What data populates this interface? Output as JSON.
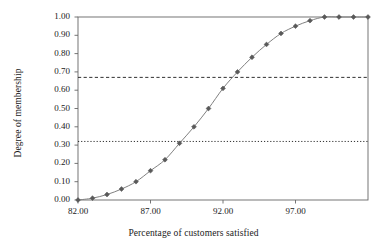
{
  "chart_data": {
    "type": "line",
    "title": "",
    "subtitle": "",
    "xlabel": "Percentage of customers satisfied",
    "ylabel": "Degree of membership",
    "xlim": [
      82,
      102
    ],
    "ylim": [
      0.0,
      1.0
    ],
    "grid": false,
    "legend": "none",
    "marker": "diamond",
    "line_color": "#808080",
    "marker_color": "#595959",
    "x": [
      82,
      83,
      84,
      85,
      86,
      87,
      88,
      89,
      90,
      91,
      92,
      93,
      94,
      95,
      96,
      97,
      98,
      99,
      100,
      101,
      102
    ],
    "y": [
      0.0,
      0.01,
      0.03,
      0.06,
      0.1,
      0.16,
      0.22,
      0.31,
      0.4,
      0.5,
      0.61,
      0.7,
      0.78,
      0.85,
      0.91,
      0.95,
      0.98,
      1.0,
      1.0,
      1.0,
      1.0
    ],
    "series": [
      {
        "name": "Degree of membership",
        "values": [
          0.0,
          0.01,
          0.03,
          0.06,
          0.1,
          0.16,
          0.22,
          0.31,
          0.4,
          0.5,
          0.61,
          0.7,
          0.78,
          0.85,
          0.91,
          0.95,
          0.98,
          1.0,
          1.0,
          1.0,
          1.0
        ]
      }
    ],
    "xticks": [
      82,
      87,
      92,
      97
    ],
    "xtick_labels": [
      "82.00",
      "87.00",
      "92.00",
      "97.00"
    ],
    "yticks": [
      0.0,
      0.1,
      0.2,
      0.3,
      0.4,
      0.5,
      0.6,
      0.7,
      0.8,
      0.9,
      1.0
    ],
    "ytick_labels": [
      "0.00",
      "0.10",
      "0.20",
      "0.30",
      "0.40",
      "0.50",
      "0.60",
      "0.70",
      "0.80",
      "0.90",
      "1.00"
    ],
    "reference_lines": [
      {
        "name": "upper-threshold",
        "value": 0.67,
        "style": "dashed",
        "color": "#1a1a1a"
      },
      {
        "name": "lower-threshold",
        "value": 0.32,
        "style": "dotted",
        "color": "#1a1a1a"
      }
    ]
  }
}
